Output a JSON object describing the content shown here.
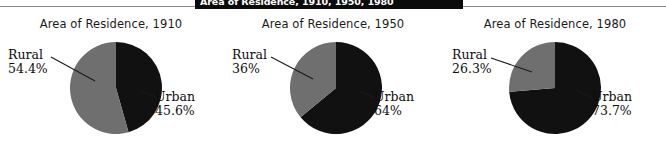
{
  "caption": {
    "text": "Area of Residence, 1910, 1950, 1980"
  },
  "colors": {
    "urban_slice": "#111111",
    "rural_slice": "#6f6f6f",
    "text": "#0d0d0d",
    "rule": "#8a8a8a",
    "banner_bg": "#0b0b0b",
    "banner_text": "#ffffff"
  },
  "chart_data": [
    {
      "type": "pie",
      "title": "Area of Residence, 1910",
      "labels": [
        "Rural",
        "Urban"
      ],
      "values": [
        54.4,
        45.6
      ],
      "value_labels": [
        "54.4%",
        "45.6%"
      ],
      "slice_colors": [
        "#6f6f6f",
        "#111111"
      ],
      "legend": "callout",
      "start_angle_deg": 0,
      "direction": "clockwise"
    },
    {
      "type": "pie",
      "title": "Area of Residence, 1950",
      "labels": [
        "Rural",
        "Urban"
      ],
      "values": [
        36,
        64
      ],
      "value_labels": [
        "36%",
        "64%"
      ],
      "slice_colors": [
        "#6f6f6f",
        "#111111"
      ],
      "legend": "callout",
      "start_angle_deg": 0,
      "direction": "clockwise"
    },
    {
      "type": "pie",
      "title": "Area of Residence, 1980",
      "labels": [
        "Rural",
        "Urban"
      ],
      "values": [
        26.3,
        73.7
      ],
      "value_labels": [
        "26.3%",
        "73.7%"
      ],
      "slice_colors": [
        "#6f6f6f",
        "#111111"
      ],
      "legend": "callout",
      "start_angle_deg": 0,
      "direction": "clockwise"
    }
  ]
}
